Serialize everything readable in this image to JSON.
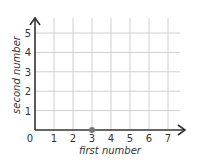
{
  "chart_data": {
    "type": "scatter",
    "title": "",
    "xlabel": "first number",
    "ylabel": "second number",
    "x_ticks": [
      "0",
      "1",
      "2",
      "3",
      "4",
      "5",
      "6",
      "7"
    ],
    "y_ticks": [
      "1",
      "2",
      "3",
      "4",
      "5"
    ],
    "xlim": [
      0,
      7.5
    ],
    "ylim": [
      0,
      5.5
    ],
    "grid": true,
    "series": [
      {
        "name": "point",
        "points": [
          {
            "x": 3,
            "y": 0
          }
        ]
      }
    ],
    "colors": {
      "grid": "#d0d0d0",
      "axis": "#333333",
      "point": "#777777"
    }
  }
}
